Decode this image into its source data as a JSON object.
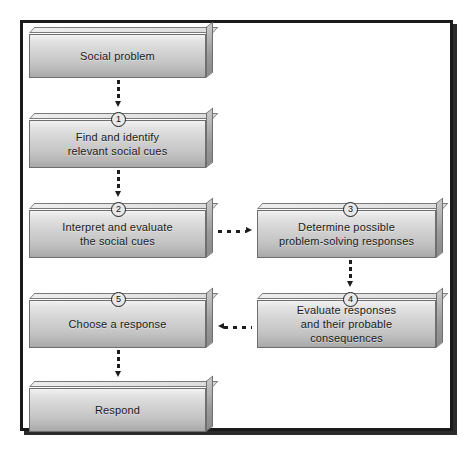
{
  "diagram": {
    "frame": {
      "border_color": "#1a1a1a",
      "background": "#ffffff"
    },
    "nodes": [
      {
        "id": "social-problem",
        "label": "Social problem",
        "step": "",
        "column": "left"
      },
      {
        "id": "find-identify-cues",
        "label": "Find and identify\nrelevant social cues",
        "step": "1",
        "column": "left"
      },
      {
        "id": "interpret-evaluate-cues",
        "label": "Interpret and evaluate\nthe social cues",
        "step": "2",
        "column": "left"
      },
      {
        "id": "determine-responses",
        "label": "Determine possible\nproblem-solving responses",
        "step": "3",
        "column": "right"
      },
      {
        "id": "evaluate-responses",
        "label": "Evaluate responses\nand their probable consequences",
        "step": "4",
        "column": "right"
      },
      {
        "id": "choose-response",
        "label": "Choose a response",
        "step": "5",
        "column": "left"
      },
      {
        "id": "respond",
        "label": "Respond",
        "step": "",
        "column": "left"
      }
    ],
    "connectors": [
      {
        "id": "social-problem-to-step1",
        "from": "social-problem",
        "to": "find-identify-cues",
        "direction": "down",
        "style": "dotted"
      },
      {
        "id": "step1-to-step2",
        "from": "find-identify-cues",
        "to": "interpret-evaluate-cues",
        "direction": "down",
        "style": "dotted"
      },
      {
        "id": "step2-to-step3",
        "from": "interpret-evaluate-cues",
        "to": "determine-responses",
        "direction": "right",
        "style": "dotted"
      },
      {
        "id": "step3-to-step4",
        "from": "determine-responses",
        "to": "evaluate-responses",
        "direction": "down",
        "style": "dotted"
      },
      {
        "id": "step4-to-step5",
        "from": "evaluate-responses",
        "to": "choose-response",
        "direction": "left",
        "style": "dotted"
      },
      {
        "id": "step5-to-respond",
        "from": "choose-response",
        "to": "respond",
        "direction": "down",
        "style": "dotted"
      }
    ]
  }
}
